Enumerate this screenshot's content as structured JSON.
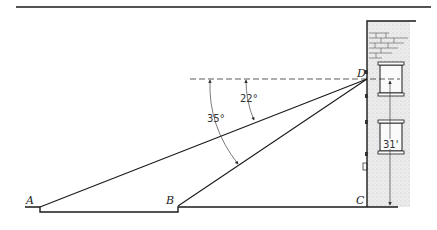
{
  "diagram": {
    "type": "trigonometry-angle-of-depression",
    "points": {
      "A": {
        "label": "A",
        "x": 40,
        "y": 207
      },
      "B": {
        "label": "B",
        "x": 178,
        "y": 206
      },
      "C": {
        "label": "C",
        "x": 367,
        "y": 207
      },
      "D": {
        "label": "D",
        "x": 367,
        "y": 79
      }
    },
    "angles": [
      {
        "label": "22°",
        "from": "horizontal at D",
        "to": "line DA"
      },
      {
        "label": "35°",
        "from": "horizontal at D",
        "to": "line DB"
      }
    ],
    "height": {
      "label": "31'",
      "from": "D",
      "to": "ground"
    },
    "elements": [
      "top-rule",
      "building-with-bricks",
      "two-windows",
      "dashed-horizontal-line",
      "ground-line"
    ]
  },
  "labels": {
    "A": "A",
    "B": "B",
    "C": "C",
    "D": "D",
    "angle_small": "22°",
    "angle_large": "35°",
    "height": "31'"
  },
  "colors": {
    "line": "#1a1a1a",
    "building_fill": "#e4e4e4",
    "background": "#ffffff"
  }
}
